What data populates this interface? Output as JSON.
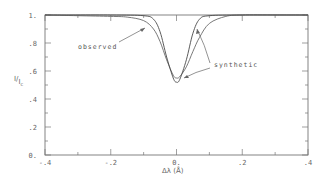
{
  "chart_data": {
    "type": "line",
    "title": "",
    "xlabel": "Δλ (Å)",
    "ylabel": "I/Ic",
    "xlim": [
      -0.4,
      0.4
    ],
    "ylim": [
      0,
      1.0
    ],
    "grid": false,
    "x_ticks": [
      "-.4",
      "-.2",
      "0.",
      ".2",
      ".4"
    ],
    "y_ticks": [
      "0.",
      ".2",
      ".4",
      ".6",
      ".8",
      "1."
    ],
    "series": [
      {
        "name": "observed",
        "x": [
          -0.4,
          -0.3,
          -0.2,
          -0.15,
          -0.1,
          -0.07,
          -0.05,
          -0.03,
          -0.01,
          0.0,
          0.01,
          0.03,
          0.05,
          0.07,
          0.1,
          0.15,
          0.2,
          0.3,
          0.4
        ],
        "y": [
          1.0,
          0.995,
          0.99,
          0.985,
          0.96,
          0.9,
          0.81,
          0.68,
          0.57,
          0.55,
          0.56,
          0.63,
          0.74,
          0.84,
          0.94,
          0.99,
          1.0,
          1.0,
          1.0
        ]
      },
      {
        "name": "synthetic",
        "x": [
          -0.4,
          -0.2,
          -0.1,
          -0.07,
          -0.05,
          -0.03,
          -0.01,
          0.0,
          0.01,
          0.03,
          0.05,
          0.07,
          0.1,
          0.2,
          0.4
        ],
        "y": [
          1.0,
          1.0,
          0.995,
          0.97,
          0.88,
          0.7,
          0.55,
          0.52,
          0.54,
          0.68,
          0.87,
          0.97,
          0.995,
          1.0,
          1.0
        ]
      }
    ],
    "annotations": [
      {
        "text": "observed",
        "points_to": "observed"
      },
      {
        "text": "synthetic",
        "points_to": "synthetic"
      }
    ]
  },
  "labels": {
    "ylabel_main": "I",
    "ylabel_sub": "I",
    "ylabel_subsub": "c",
    "xlabel": "Δλ (Å)",
    "observed": "observed",
    "synthetic": "synthetic"
  }
}
